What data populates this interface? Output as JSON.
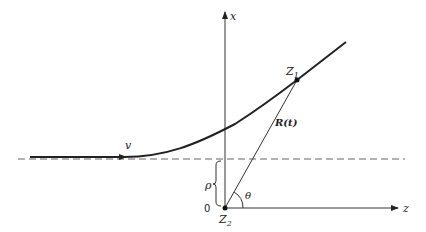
{
  "diagram": {
    "axes": {
      "vertical_label": "x",
      "horizontal_label": "z",
      "origin_label": "0"
    },
    "labels": {
      "velocity": "v",
      "particle_point": "Z",
      "particle_sub": "1",
      "target_point": "Z",
      "target_sub": "2",
      "distance": "R(t)",
      "angle": "θ",
      "impact_parameter": "ρ"
    },
    "colors": {
      "stroke": "#222222",
      "dashed": "#666666",
      "background": "#ffffff"
    }
  }
}
